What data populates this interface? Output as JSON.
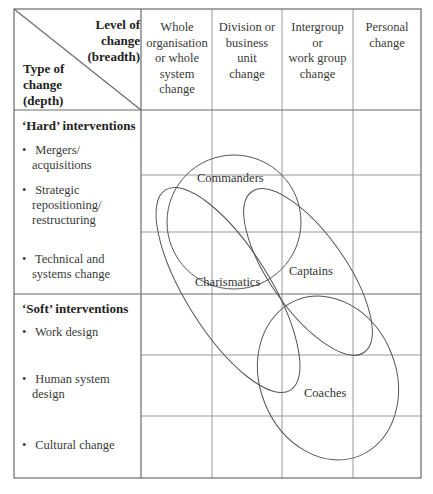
{
  "header": {
    "corner": {
      "top_label_lines": [
        "Level of",
        "change",
        "(breadth)"
      ],
      "bottom_label_lines": [
        "Type of",
        "change",
        "(depth)"
      ]
    },
    "columns": [
      {
        "label_lines": [
          "Whole",
          "organisation",
          "or whole",
          "system",
          "change"
        ]
      },
      {
        "label_lines": [
          "Division or",
          "business",
          "unit",
          "change"
        ]
      },
      {
        "label_lines": [
          "Intergroup",
          "or",
          "work group",
          "change"
        ]
      },
      {
        "label_lines": [
          "Personal",
          "change"
        ]
      }
    ]
  },
  "rows": {
    "hard": {
      "title": "‘Hard’ interventions",
      "items": [
        {
          "lines": [
            "Mergers/",
            "acquisitions"
          ]
        },
        {
          "lines": [
            "Strategic",
            "repositioning/",
            "restructuring"
          ]
        },
        {
          "lines": [
            "Technical and",
            "systems change"
          ]
        }
      ]
    },
    "soft": {
      "title": "‘Soft’ interventions",
      "items": [
        {
          "lines": [
            "Work design"
          ]
        },
        {
          "lines": [
            "Human system",
            "design"
          ]
        },
        {
          "lines": [
            "Cultural change"
          ]
        }
      ]
    }
  },
  "ellipses": [
    {
      "label": "Commanders"
    },
    {
      "label": "Charismatics"
    },
    {
      "label": "Captains"
    },
    {
      "label": "Coaches"
    }
  ],
  "colors": {
    "grid": "#8a8a8a",
    "border": "#6a6a6a",
    "ellipse_stroke": "#555555"
  }
}
